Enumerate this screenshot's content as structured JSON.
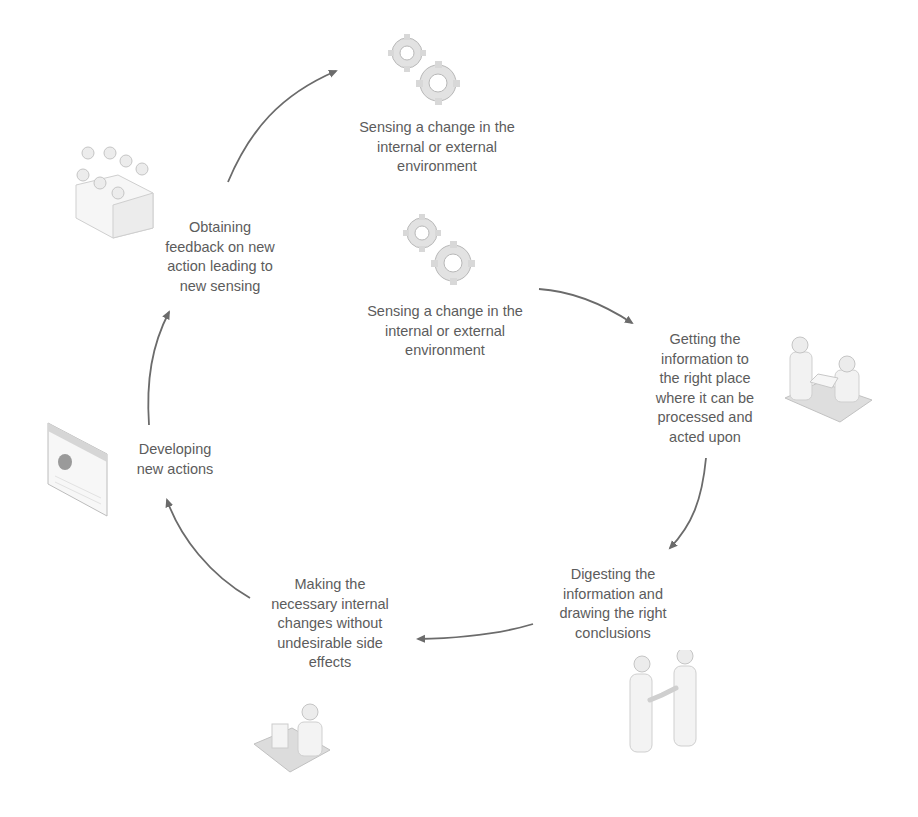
{
  "diagram": {
    "type": "cycle",
    "colors": {
      "arrow": "#6b6b6b",
      "text": "#5c5c5c",
      "icon_fill": "#e8e8e8",
      "icon_stroke": "#b5b5b5"
    },
    "nodes": [
      {
        "id": "sensing-top",
        "icon": "gears-icon",
        "lines": [
          "Sensing a change in the",
          "internal or external",
          "environment"
        ]
      },
      {
        "id": "sensing-center",
        "icon": "gears-icon",
        "lines": [
          "Sensing a change in the",
          "internal or external",
          "environment"
        ]
      },
      {
        "id": "getting-information",
        "icon": "people-at-desk-icon",
        "lines": [
          "Getting the",
          "information to",
          "the right place",
          "where it can be",
          "processed and",
          "acted upon"
        ]
      },
      {
        "id": "digesting",
        "icon": "handshake-people-icon",
        "lines": [
          "Digesting the",
          "information and",
          "drawing the right",
          "conclusions"
        ]
      },
      {
        "id": "making-changes",
        "icon": "person-at-computer-icon",
        "lines": [
          "Making the",
          "necessary internal",
          "changes without",
          "undesirable side",
          "effects"
        ]
      },
      {
        "id": "developing-actions",
        "icon": "document-window-icon",
        "lines": [
          "Developing",
          "new actions"
        ]
      },
      {
        "id": "obtaining-feedback",
        "icon": "meeting-table-icon",
        "lines": [
          "Obtaining",
          "feedback on new",
          "action leading to",
          "new sensing"
        ]
      }
    ],
    "edges": [
      {
        "from": "sensing-center",
        "to": "getting-information"
      },
      {
        "from": "getting-information",
        "to": "digesting"
      },
      {
        "from": "digesting",
        "to": "making-changes"
      },
      {
        "from": "making-changes",
        "to": "developing-actions"
      },
      {
        "from": "developing-actions",
        "to": "obtaining-feedback"
      },
      {
        "from": "obtaining-feedback",
        "to": "sensing-top"
      }
    ]
  }
}
